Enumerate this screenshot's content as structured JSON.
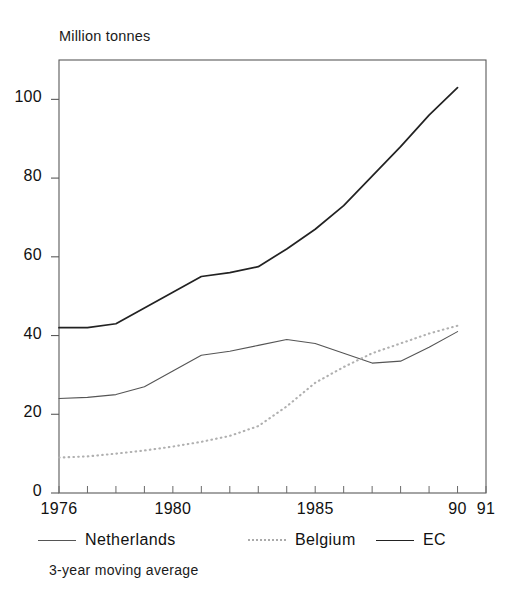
{
  "chart_data": {
    "type": "line",
    "title": "Million tonnes",
    "subtitle": "",
    "xlabel": "",
    "ylabel": "Million tonnes",
    "note": "3-year moving average",
    "grid": false,
    "legend_position": "bottom",
    "xlim": [
      1976,
      1991
    ],
    "ylim": [
      0,
      110
    ],
    "yticks": [
      0,
      20,
      40,
      60,
      80,
      100
    ],
    "ytick_labels": [
      "0",
      "20",
      "40",
      "60",
      "80",
      "100"
    ],
    "xticks": [
      1976,
      1977,
      1978,
      1979,
      1980,
      1981,
      1982,
      1983,
      1984,
      1985,
      1986,
      1987,
      1988,
      1989,
      1990,
      1991
    ],
    "xtick_labels": [
      {
        "value": 1976,
        "label": "1976"
      },
      {
        "value": 1980,
        "label": "1980"
      },
      {
        "value": 1985,
        "label": "1985"
      },
      {
        "value": 1990,
        "label": "90"
      },
      {
        "value": 1991,
        "label": "91"
      }
    ],
    "x": [
      1976,
      1977,
      1978,
      1979,
      1980,
      1981,
      1982,
      1983,
      1984,
      1985,
      1986,
      1987,
      1988,
      1989,
      1990
    ],
    "series": [
      {
        "name": "Netherlands",
        "style": "solid-thin",
        "color": "#555555",
        "values": [
          24,
          24.3,
          25,
          27,
          31,
          35,
          36,
          37.5,
          39,
          38,
          35.5,
          33,
          33.5,
          37,
          41
        ]
      },
      {
        "name": "Belgium",
        "style": "dotted",
        "color": "#b0b0b0",
        "values": [
          9,
          9.3,
          10,
          10.8,
          11.8,
          13,
          14.5,
          17,
          22,
          28,
          32,
          35.5,
          38,
          40.5,
          42.5
        ]
      },
      {
        "name": "EC",
        "style": "solid-thick",
        "color": "#222222",
        "values": [
          42,
          42,
          43,
          47,
          51,
          55,
          56,
          57.5,
          62,
          67,
          73,
          80.5,
          88,
          96,
          103
        ]
      }
    ]
  },
  "legend": {
    "items": [
      {
        "label": "Netherlands",
        "style": "solid-thin"
      },
      {
        "label": "Belgium",
        "style": "dotted"
      },
      {
        "label": "EC",
        "style": "solid-thick"
      }
    ]
  },
  "footnote": "3-year moving average"
}
